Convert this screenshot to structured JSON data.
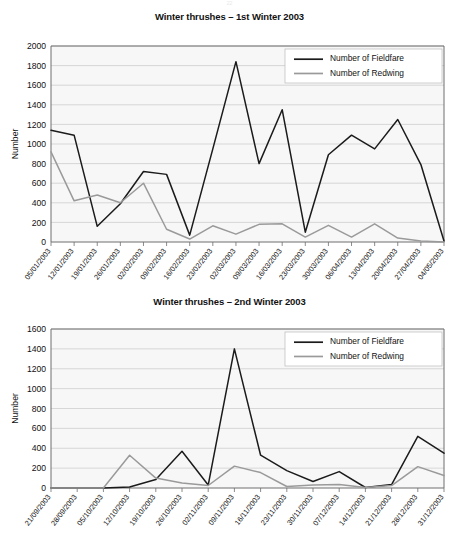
{
  "page": {
    "header_mark": "22"
  },
  "colors": {
    "fieldfare": "#1b1b1b",
    "redwing": "#9a9a9a",
    "grid": "#c9c9c9",
    "axis": "#6e6e6e",
    "plot_background": "#f7f7f7"
  },
  "chart_data": [
    {
      "id": "chart1",
      "type": "line",
      "title": "Winter thrushes – 1st Winter 2003",
      "xlabel": "",
      "ylabel": "Number",
      "ylim": [
        0,
        2000
      ],
      "ytick_step": 200,
      "yticks": [
        0,
        200,
        400,
        600,
        800,
        1000,
        1200,
        1400,
        1600,
        1800,
        2000
      ],
      "grid": true,
      "legend_position": "top-right",
      "categories": [
        "05/01/2003",
        "12/01/2003",
        "19/01/2003",
        "26/01/2003",
        "02/02/2003",
        "09/02/2003",
        "16/02/2003",
        "23/02/2003",
        "02/03/2003",
        "09/03/2003",
        "16/03/2003",
        "23/03/2003",
        "30/03/2003",
        "06/04/2003",
        "13/04/2003",
        "20/04/2003",
        "27/04/2003",
        "04/05/2003"
      ],
      "series": [
        {
          "name": "Number of Fieldfare",
          "color": "#1b1b1b",
          "values": [
            1140,
            1090,
            160,
            390,
            720,
            690,
            70,
            950,
            1840,
            800,
            1350,
            100,
            890,
            1090,
            950,
            1250,
            790,
            10
          ]
        },
        {
          "name": "Number of Redwing",
          "color": "#9a9a9a",
          "values": [
            920,
            420,
            480,
            400,
            600,
            130,
            30,
            165,
            80,
            180,
            185,
            50,
            170,
            50,
            185,
            40,
            10,
            0
          ]
        }
      ]
    },
    {
      "id": "chart2",
      "type": "line",
      "title": "Winter thrushes – 2nd Winter 2003",
      "xlabel": "",
      "ylabel": "Number",
      "ylim": [
        0,
        1600
      ],
      "ytick_step": 200,
      "yticks": [
        0,
        200,
        400,
        600,
        800,
        1000,
        1200,
        1400,
        1600
      ],
      "grid": true,
      "legend_position": "top-right",
      "categories": [
        "21/09/2003",
        "28/09/2003",
        "05/10/2003",
        "12/10/2003",
        "19/10/2003",
        "26/10/2003",
        "02/11/2003",
        "09/11/2003",
        "16/11/2003",
        "23/11/2003",
        "30/11/2003",
        "07/12/2003",
        "14/12/2003",
        "21/12/2003",
        "28/12/2003",
        "31/12/2003"
      ],
      "series": [
        {
          "name": "Number of Fieldfare",
          "color": "#1b1b1b",
          "values": [
            0,
            0,
            0,
            10,
            85,
            370,
            30,
            1400,
            330,
            175,
            65,
            165,
            5,
            35,
            520,
            350
          ]
        },
        {
          "name": "Number of Redwing",
          "color": "#9a9a9a",
          "values": [
            0,
            0,
            0,
            330,
            100,
            50,
            25,
            220,
            155,
            15,
            30,
            35,
            5,
            25,
            215,
            125
          ]
        }
      ]
    }
  ]
}
